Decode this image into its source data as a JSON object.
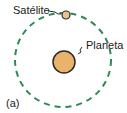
{
  "diagram": {
    "satellite_label": "Satélite",
    "planet_label": "Planeta",
    "panel_label": "(a)",
    "colors": {
      "orbit": "#2e8b57",
      "planet": "#e8b36a",
      "satellite": "#e8c48a",
      "outline": "#2a2a2a"
    }
  }
}
